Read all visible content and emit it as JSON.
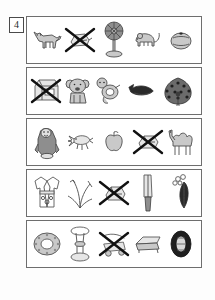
{
  "worksheet": {
    "exercise_number": "4",
    "rows": [
      {
        "row_index": 1,
        "items": [
          {
            "icon": "fox-icon",
            "label": "fox",
            "crossed_out": false
          },
          {
            "icon": "crossed-object-icon",
            "label": "crossed out object",
            "crossed_out": true
          },
          {
            "icon": "electric-fan-icon",
            "label": "electric fan",
            "crossed_out": false
          },
          {
            "icon": "mouse-icon",
            "label": "mouse",
            "crossed_out": false
          },
          {
            "icon": "orange-fruit-icon",
            "label": "orange",
            "crossed_out": false
          }
        ]
      },
      {
        "row_index": 2,
        "items": [
          {
            "icon": "crossed-machine-icon",
            "label": "crossed out machine",
            "crossed_out": true
          },
          {
            "icon": "koala-icon",
            "label": "koala",
            "crossed_out": false
          },
          {
            "icon": "sea-otter-icon",
            "label": "sea otter",
            "crossed_out": false
          },
          {
            "icon": "whale-icon",
            "label": "whale",
            "crossed_out": false
          },
          {
            "icon": "peacock-icon",
            "label": "peacock",
            "crossed_out": false
          }
        ]
      },
      {
        "row_index": 3,
        "items": [
          {
            "icon": "gorilla-icon",
            "label": "gorilla",
            "crossed_out": false
          },
          {
            "icon": "crab-icon",
            "label": "crab",
            "crossed_out": false
          },
          {
            "icon": "apple-icon",
            "label": "apple",
            "crossed_out": false
          },
          {
            "icon": "crossed-object-icon",
            "label": "crossed out object",
            "crossed_out": true
          },
          {
            "icon": "camel-icon",
            "label": "camel",
            "crossed_out": false
          }
        ]
      },
      {
        "row_index": 4,
        "items": [
          {
            "icon": "kimono-icon",
            "label": "kimono",
            "crossed_out": false
          },
          {
            "icon": "grass-plant-icon",
            "label": "grass plant",
            "crossed_out": false
          },
          {
            "icon": "crossed-object-icon",
            "label": "crossed out object",
            "crossed_out": true
          },
          {
            "icon": "cleaver-knife-icon",
            "label": "cleaver knife",
            "crossed_out": false
          },
          {
            "icon": "feather-plume-icon",
            "label": "feather plume",
            "crossed_out": false
          }
        ]
      },
      {
        "row_index": 5,
        "items": [
          {
            "icon": "donut-ring-icon",
            "label": "donut ring",
            "crossed_out": false
          },
          {
            "icon": "pedestal-stand-icon",
            "label": "pedestal stand",
            "crossed_out": false
          },
          {
            "icon": "crossed-cart-icon",
            "label": "crossed out cart",
            "crossed_out": true
          },
          {
            "icon": "bench-sofa-icon",
            "label": "bench sofa",
            "crossed_out": false
          },
          {
            "icon": "tire-icon",
            "label": "tire",
            "crossed_out": false
          }
        ]
      }
    ]
  },
  "colors": {
    "page_background": "#fdfdfd",
    "row_border": "#6e6e6e",
    "cross_mark": "#111111",
    "artwork_stroke": "#4e4e4e",
    "artwork_fill": "#c9c9c9"
  }
}
